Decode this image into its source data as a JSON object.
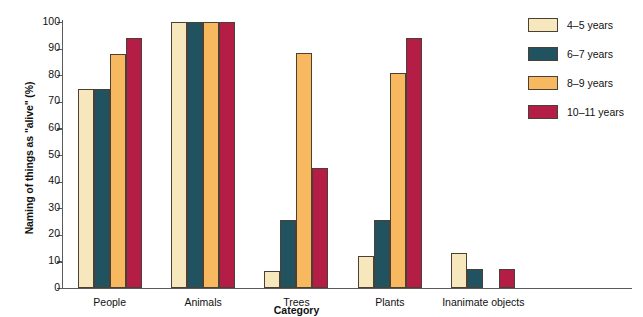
{
  "chart_data": {
    "type": "bar",
    "title": "",
    "xlabel": "Category",
    "ylabel": "Naming of things as \"alive\" (%)",
    "categories": [
      "People",
      "Animals",
      "Trees",
      "Plants",
      "Inanimate objects"
    ],
    "series": [
      {
        "name": "4–5 years",
        "color": "#F7E7BC",
        "values": [
          75,
          100,
          6.5,
          12,
          13
        ]
      },
      {
        "name": "6–7 years",
        "color": "#215260",
        "values": [
          75,
          100,
          25.5,
          25.5,
          7
        ]
      },
      {
        "name": "8–9 years",
        "color": "#F7B860",
        "values": [
          88,
          100,
          88.5,
          81,
          0
        ]
      },
      {
        "name": "10–11 years",
        "color": "#B41E46",
        "values": [
          94,
          100,
          45,
          94,
          7
        ]
      }
    ],
    "ylim": [
      0,
      100
    ],
    "ytick_step": 10,
    "yticks": [
      "100",
      "90",
      "80",
      "70",
      "60",
      "50",
      "40",
      "30",
      "20",
      "10",
      "0"
    ],
    "grid": false,
    "legend_position": "right"
  }
}
